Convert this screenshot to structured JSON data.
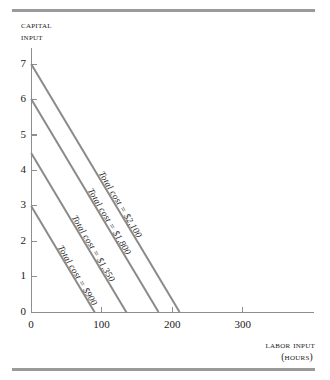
{
  "figure": {
    "name": "isocost-line-chart",
    "background": "#ffffff",
    "rule_color": "#9a9a9a",
    "axis_color": "#8e8e8e",
    "line_color": "#8a8a8a"
  },
  "axes": {
    "y": {
      "title_line1": "Capital",
      "title_line2": "input",
      "ticks": [
        0,
        1,
        2,
        3,
        4,
        5,
        6,
        7
      ],
      "tick_labels": [
        "0",
        "1",
        "2",
        "3",
        "4",
        "5",
        "6",
        "7"
      ],
      "min": 0,
      "max": 7.5
    },
    "x": {
      "title_line1": "Labor input",
      "title_line2": "(hours)",
      "ticks": [
        0,
        100,
        200,
        300
      ],
      "tick_labels": [
        "0",
        "100",
        "200",
        "300"
      ],
      "min": 0,
      "max": 400
    }
  },
  "chart_data": {
    "type": "line",
    "title": "",
    "subtitle": "",
    "xlabel": "Labor input (hours)",
    "ylabel": "Capital input",
    "xlim": [
      0,
      400
    ],
    "ylim": [
      0,
      7.5
    ],
    "grid": false,
    "legend": "inline-labels",
    "series": [
      {
        "name": "Total cost = $900",
        "label": "Total cost = $900",
        "x": [
          0,
          90
        ],
        "y": [
          3,
          0
        ],
        "capital_intercept": 3,
        "labor_intercept": 90,
        "total_cost": 900
      },
      {
        "name": "Total cost = $1,350",
        "label": "Total cost = $1,350",
        "x": [
          0,
          135
        ],
        "y": [
          4.5,
          0
        ],
        "capital_intercept": 4.5,
        "labor_intercept": 135,
        "total_cost": 1350
      },
      {
        "name": "Total cost = $1,800",
        "label": "Total cost = $1,800",
        "x": [
          0,
          180
        ],
        "y": [
          6,
          0
        ],
        "capital_intercept": 6,
        "labor_intercept": 180,
        "total_cost": 1800
      },
      {
        "name": "Total cost = $2,100",
        "label": "Total cost = $2,100",
        "x": [
          0,
          210
        ],
        "y": [
          7,
          0
        ],
        "capital_intercept": 7,
        "labor_intercept": 210,
        "total_cost": 2100
      }
    ]
  }
}
